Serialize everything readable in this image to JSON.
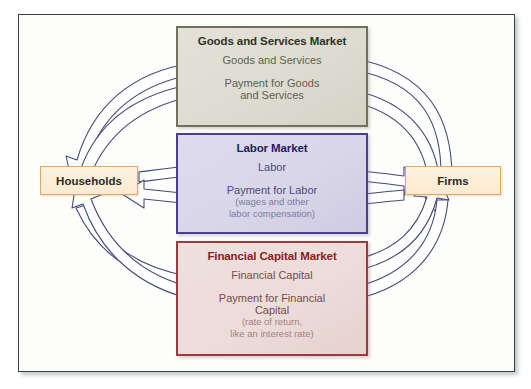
{
  "diagram": {
    "type": "circular-flow",
    "actors": {
      "households": {
        "label": "Households"
      },
      "firms": {
        "label": "Firms"
      }
    },
    "markets": [
      {
        "id": "goods",
        "title": "Goods and Services Market",
        "flow_to_households": "Goods and Services",
        "flow_to_firms_line1": "Payment for Goods",
        "flow_to_firms_line2": "and Services",
        "border_color": "#6e7259",
        "fill_color": "#dedcd1",
        "title_color": "#2f3326"
      },
      {
        "id": "labor",
        "title": "Labor Market",
        "flow_to_firms": "Labor",
        "flow_to_households": "Payment for Labor",
        "note_line1": "(wages and other",
        "note_line2": "labor compensation)",
        "border_color": "#4b3f91",
        "fill_color": "#d9d6e9",
        "title_color": "#1f2260"
      },
      {
        "id": "financial",
        "title": "Financial Capital Market",
        "flow_to_firms": "Financial Capital",
        "flow_to_households_line1": "Payment for Financial",
        "flow_to_households_line2": "Capital",
        "note_line1": "(rate of return,",
        "note_line2": "like an interest rate)",
        "border_color": "#9e3a3a",
        "fill_color": "#ecdcda",
        "title_color": "#8d1b1b"
      }
    ],
    "arrow_style": {
      "fill": "#ffffff",
      "outline": "#454b78"
    }
  }
}
